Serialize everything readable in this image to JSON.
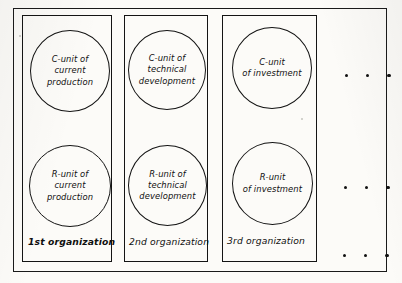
{
  "figure": {
    "kind": "organization-units-diagram",
    "columns": [
      {
        "caption": "1st organization",
        "caption_emphasis": "bold",
        "units": [
          {
            "role": "C-unit",
            "text": "C-unit of\ncurrent\nproduction"
          },
          {
            "role": "R-unit",
            "text": "R-unit of\ncurrent\nproduction"
          }
        ]
      },
      {
        "caption": "2nd organization",
        "caption_emphasis": "normal",
        "units": [
          {
            "role": "C-unit",
            "text": "C-unit of\ntechnical\ndevelopment"
          },
          {
            "role": "R-unit",
            "text": "R-unit of\ntechnical\ndevelopment"
          }
        ]
      },
      {
        "caption": "3rd organization",
        "caption_emphasis": "normal",
        "units": [
          {
            "role": "C-unit",
            "text": "C-unit\nof investment"
          },
          {
            "role": "R-unit",
            "text": "R-unit\nof investment"
          }
        ]
      }
    ],
    "continuation": {
      "symbol": "ellipsis-dots",
      "rows": 3,
      "dots_per_row": 3
    },
    "colors": {
      "ink": "#131313",
      "paper": "#fcfbf8"
    }
  }
}
